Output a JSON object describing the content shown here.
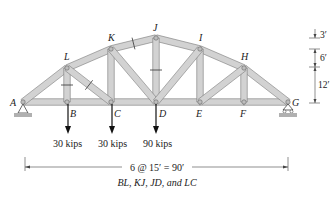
{
  "diagram": {
    "type": "truss",
    "colors": {
      "member_fill": "#d2d2d2",
      "member_edge": "#7a7a7a",
      "pin": "#9a9a9a",
      "ground": "#b0b0b0",
      "line": "#222222"
    },
    "nodes": {
      "A": {
        "x": 23,
        "y": 102,
        "label": "A"
      },
      "B": {
        "x": 67,
        "y": 102,
        "label": "B"
      },
      "C": {
        "x": 111,
        "y": 102,
        "label": "C"
      },
      "D": {
        "x": 156,
        "y": 102,
        "label": "D"
      },
      "E": {
        "x": 200,
        "y": 102,
        "label": "E"
      },
      "F": {
        "x": 244,
        "y": 102,
        "label": "F"
      },
      "G": {
        "x": 288,
        "y": 102,
        "label": "G"
      },
      "L": {
        "x": 67,
        "y": 68,
        "label": "L"
      },
      "K": {
        "x": 111,
        "y": 49,
        "label": "K"
      },
      "J": {
        "x": 156,
        "y": 38,
        "label": "J"
      },
      "I": {
        "x": 200,
        "y": 49,
        "label": "I"
      },
      "H": {
        "x": 244,
        "y": 68,
        "label": "H"
      }
    },
    "members": [
      [
        "A",
        "B"
      ],
      [
        "B",
        "C"
      ],
      [
        "C",
        "D"
      ],
      [
        "D",
        "E"
      ],
      [
        "E",
        "F"
      ],
      [
        "F",
        "G"
      ],
      [
        "A",
        "L"
      ],
      [
        "L",
        "K"
      ],
      [
        "K",
        "J"
      ],
      [
        "J",
        "I"
      ],
      [
        "I",
        "H"
      ],
      [
        "H",
        "G"
      ],
      [
        "L",
        "B"
      ],
      [
        "K",
        "C"
      ],
      [
        "J",
        "D"
      ],
      [
        "I",
        "E"
      ],
      [
        "H",
        "F"
      ],
      [
        "L",
        "C"
      ],
      [
        "K",
        "D"
      ],
      [
        "I",
        "D"
      ],
      [
        "H",
        "E"
      ]
    ],
    "cut_members": [
      "BL",
      "KJ",
      "JD",
      "LC"
    ],
    "loads": [
      {
        "node": "B",
        "label": "30 kips"
      },
      {
        "node": "C",
        "label": "30 kips"
      },
      {
        "node": "D",
        "label": "90 kips"
      }
    ],
    "supports": {
      "A": "pin",
      "G": "roller"
    },
    "span_dimension": "6 @ 15′ = 90′",
    "caption": "BL, KJ, JD, and LC",
    "height_dimensions": [
      {
        "label": "3′"
      },
      {
        "label": "6′"
      },
      {
        "label": "12′"
      }
    ]
  }
}
